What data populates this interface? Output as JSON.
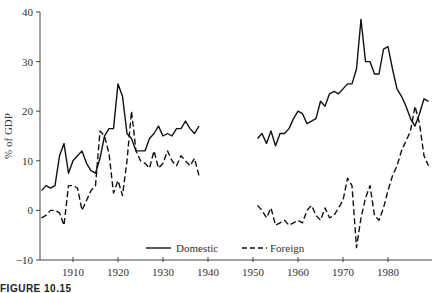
{
  "caption": "FIGURE 10.15",
  "chart_data": {
    "type": "line",
    "title": "",
    "xlabel": "",
    "ylabel": "% of GDP",
    "xlim": [
      1902.7,
      1990
    ],
    "ylim": [
      -10,
      40
    ],
    "xticks": [
      1910,
      1920,
      1930,
      1940,
      1950,
      1960,
      1970,
      1980
    ],
    "yticks": [
      -10,
      0,
      10,
      20,
      30,
      40
    ],
    "grid": false,
    "legend_position": "bottom-center",
    "series": [
      {
        "name": "Domestic",
        "style": "solid",
        "segments": [
          {
            "x": [
              1903,
              1904,
              1905,
              1906,
              1907,
              1908,
              1909,
              1910,
              1911,
              1912,
              1913,
              1914,
              1915,
              1916,
              1917,
              1918,
              1919,
              1920,
              1921,
              1922,
              1923,
              1924,
              1925,
              1926,
              1927,
              1928,
              1929,
              1930,
              1931,
              1932,
              1933,
              1934,
              1935,
              1936,
              1937,
              1938
            ],
            "y": [
              4,
              5,
              4.5,
              5,
              11,
              13.5,
              7.5,
              10,
              11,
              12,
              9.5,
              8,
              7.5,
              10.5,
              15,
              16.5,
              16.5,
              25.5,
              23,
              15.5,
              14.5,
              12,
              12,
              12,
              14.5,
              15.5,
              17,
              15,
              15.5,
              15,
              16.5,
              16.5,
              18,
              16.5,
              15.5,
              17
            ]
          },
          {
            "x": [
              1951,
              1952,
              1953,
              1954,
              1955,
              1956,
              1957,
              1958,
              1959,
              1960,
              1961,
              1962,
              1963,
              1964,
              1965,
              1966,
              1967,
              1968,
              1969,
              1970,
              1971,
              1972,
              1973,
              1974,
              1975,
              1976,
              1977,
              1978,
              1979,
              1980,
              1981,
              1982,
              1983,
              1984,
              1985,
              1986,
              1987,
              1988,
              1989
            ],
            "y": [
              14.5,
              15.5,
              13.5,
              16,
              13,
              15.5,
              15.5,
              16.5,
              18.5,
              20,
              19.5,
              17.5,
              18,
              18.5,
              22,
              21,
              23.5,
              24,
              23.5,
              24.5,
              25.5,
              25.5,
              28.5,
              38.5,
              30,
              30,
              27.5,
              27.5,
              32.5,
              33,
              28.5,
              24.5,
              23,
              21,
              18.5,
              17,
              19.5,
              22.5,
              22
            ]
          }
        ]
      },
      {
        "name": "Foreign",
        "style": "dashed",
        "segments": [
          {
            "x": [
              1903,
              1904,
              1905,
              1906,
              1907,
              1908,
              1909,
              1910,
              1911,
              1912,
              1913,
              1914,
              1915,
              1916,
              1917,
              1918,
              1919,
              1920,
              1921,
              1922,
              1923,
              1924,
              1925,
              1926,
              1927,
              1928,
              1929,
              1930,
              1931,
              1932,
              1933,
              1934,
              1935,
              1936,
              1937,
              1938
            ],
            "y": [
              -1.5,
              -1,
              0,
              0,
              -0.5,
              -3,
              5,
              5,
              4.5,
              0,
              2,
              4,
              5,
              16,
              15,
              11.5,
              3.5,
              6,
              3,
              10,
              20,
              12,
              10,
              9.5,
              8.5,
              12,
              8.5,
              9.5,
              12,
              10,
              9,
              11,
              10,
              9,
              10.5,
              7
            ]
          },
          {
            "x": [
              1951,
              1952,
              1953,
              1954,
              1955,
              1956,
              1957,
              1958,
              1959,
              1960,
              1961,
              1962,
              1963,
              1964,
              1965,
              1966,
              1967,
              1968,
              1969,
              1970,
              1971,
              1972,
              1973,
              1974,
              1975,
              1976,
              1977,
              1978,
              1979,
              1980,
              1981,
              1982,
              1983,
              1984,
              1985,
              1986,
              1987,
              1988,
              1989
            ],
            "y": [
              1,
              0,
              -1.5,
              0.5,
              -3,
              -2.5,
              -2,
              -3,
              -2.5,
              -2,
              -2.5,
              0,
              1,
              -1,
              -2,
              0.5,
              -1.5,
              -1,
              0.5,
              2,
              6.5,
              5,
              -7.5,
              -1.5,
              2.5,
              5,
              -1,
              -2,
              0.5,
              4,
              7,
              9,
              12,
              14,
              16,
              21,
              17.5,
              11,
              9
            ]
          }
        ]
      }
    ]
  }
}
